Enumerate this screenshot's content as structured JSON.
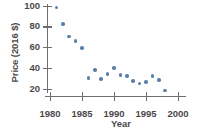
{
  "chart_data": {
    "type": "scatter",
    "title": "",
    "xlabel": "Year",
    "ylabel": "Price (2016 $)",
    "xlim": [
      1978.5,
      2001
    ],
    "ylim": [
      12,
      104
    ],
    "grid": false,
    "legend": null,
    "marker_color": "#5a7fa8",
    "axis_color": "#6e6e6e",
    "text_color": "#4a4a4a",
    "xticks": [
      1980,
      1985,
      1990,
      1995,
      2000
    ],
    "xtick_labels": [
      "1980",
      "1985",
      "1990",
      "1995",
      "2000"
    ],
    "yticks": [
      20,
      40,
      60,
      80,
      100
    ],
    "ytick_labels": [
      "20",
      "40",
      "60",
      "80",
      "100"
    ],
    "x": [
      1981,
      1982,
      1983,
      1984,
      1985,
      1986,
      1987,
      1988,
      1989,
      1990,
      1991,
      1992,
      1993,
      1994,
      1995,
      1996,
      1997,
      1998
    ],
    "y": [
      98,
      82,
      70,
      66,
      59,
      30,
      38,
      29,
      34,
      40,
      33,
      32,
      27,
      25,
      26,
      32,
      28,
      18
    ],
    "points": [
      {
        "year": 1981,
        "price": 98
      },
      {
        "year": 1982,
        "price": 82
      },
      {
        "year": 1983,
        "price": 70
      },
      {
        "year": 1984,
        "price": 66
      },
      {
        "year": 1985,
        "price": 59
      },
      {
        "year": 1986,
        "price": 30
      },
      {
        "year": 1987,
        "price": 38
      },
      {
        "year": 1988,
        "price": 29
      },
      {
        "year": 1989,
        "price": 34
      },
      {
        "year": 1990,
        "price": 40
      },
      {
        "year": 1991,
        "price": 33
      },
      {
        "year": 1992,
        "price": 32
      },
      {
        "year": 1993,
        "price": 27
      },
      {
        "year": 1994,
        "price": 25
      },
      {
        "year": 1995,
        "price": 26
      },
      {
        "year": 1996,
        "price": 32
      },
      {
        "year": 1997,
        "price": 28
      },
      {
        "year": 1998,
        "price": 18
      }
    ]
  }
}
